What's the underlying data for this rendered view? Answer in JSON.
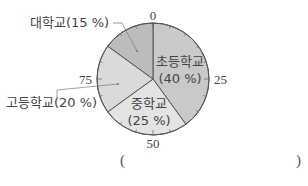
{
  "chart_data": {
    "type": "pie",
    "title": "",
    "start_angle_deg": 0,
    "direction": "clockwise",
    "scale_ticks": [
      0,
      25,
      50,
      75
    ],
    "categories": [
      "초등학교",
      "중학교",
      "고등학교",
      "대학교"
    ],
    "values": [
      40,
      25,
      20,
      15
    ],
    "unit": "%",
    "colors": [
      "#c9c9c9",
      "#e3e3e3",
      "#dadada",
      "#bcbcbc"
    ],
    "labels": {
      "elementary": {
        "name": "초등학교",
        "pct": "(40 %)"
      },
      "middle": {
        "name": "중학교",
        "pct": "(25 %)"
      },
      "high": {
        "name": "고등학교(20 %)"
      },
      "university": {
        "name": "대학교(15 %)"
      }
    },
    "tick_labels": {
      "t0": "0",
      "t25": "25",
      "t50": "50",
      "t75": "75"
    }
  },
  "answer": {
    "open": "(",
    "close": ")"
  }
}
